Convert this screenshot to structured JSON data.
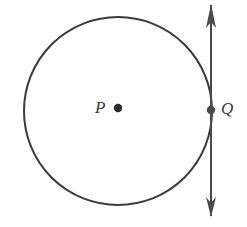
{
  "figure": {
    "kind": "geometry-diagram",
    "background_color": "#ffffff",
    "stroke_color": "#3a3a3a",
    "stroke_width": 2,
    "width": 247,
    "height": 227
  },
  "circle": {
    "name": "circle-P",
    "center_x": 118,
    "center_y": 111,
    "radius": 94,
    "fill": "none",
    "stroke_color": "#3a3a3a",
    "stroke_width": 2
  },
  "points": [
    {
      "id": "P",
      "label": "P",
      "role": "center",
      "dot_x": 118,
      "dot_y": 108,
      "dot_radius": 4,
      "label_x": 95,
      "label_y": 99,
      "color": "#2b2b2b"
    },
    {
      "id": "Q",
      "label": "Q",
      "role": "tangent-point",
      "dot_x": 211,
      "dot_y": 110,
      "dot_radius": 4,
      "label_x": 221,
      "label_y": 100,
      "color": "#4a4a4a"
    }
  ],
  "tangent_line": {
    "name": "tangent-line-through-Q",
    "orientation": "vertical",
    "x": 211,
    "y_top": 5,
    "y_bottom": 216,
    "arrowheads": "both",
    "arrow_head_length_top": 23,
    "arrow_head_length_bottom": 20,
    "arrow_head_half_width": 5,
    "stroke_color": "#4a4a4a",
    "stroke_width": 2
  }
}
